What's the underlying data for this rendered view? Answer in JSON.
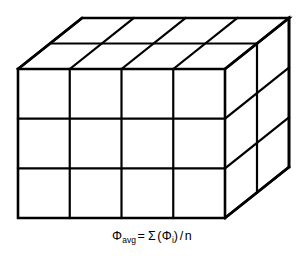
{
  "figure": {
    "background_color": "#ffffff",
    "line_color": "#000000"
  },
  "cube": {
    "name": "subdivided-block",
    "columns": 4,
    "rows": 3,
    "depth": 2,
    "geometry": {
      "front_left_x": 18,
      "front_right_x": 225,
      "front_top_y": 69,
      "front_bottom_y": 218,
      "depth_dx": 64,
      "depth_dy": -51,
      "column_x": [
        18,
        69.75,
        121.5,
        173.25,
        225
      ],
      "row_y": [
        69,
        118.67,
        168.33,
        218
      ],
      "depth_step_x": [
        0,
        32,
        64
      ],
      "depth_step_y": [
        0,
        -25.5,
        -51
      ]
    },
    "faces": [
      {
        "id": "front",
        "label": "front-face",
        "cells": 12
      },
      {
        "id": "top",
        "label": "top-face",
        "cells": 8
      },
      {
        "id": "right",
        "label": "right-face",
        "cells": 6
      }
    ]
  },
  "caption": {
    "formula_plain": "Φavg = Σ (Φi) / n",
    "lhs_symbol": "Φ",
    "lhs_subscript": "avg",
    "equals": "=",
    "sigma": "Σ",
    "open_paren": "(",
    "term_symbol": "Φ",
    "term_subscript": "i",
    "close_paren": ")",
    "divide": "/",
    "denominator": "n"
  }
}
